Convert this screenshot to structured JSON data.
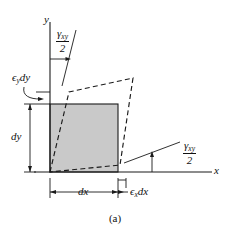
{
  "figure": {
    "caption": "(a)",
    "type": "strain-element-deformation-diagram",
    "axes": {
      "x_label": "x",
      "y_label": "y"
    },
    "labels": {
      "shear_numerator": "γ",
      "shear_subscript": "xy",
      "shear_denominator": "2",
      "shear_top": "γxy/2",
      "shear_right": "γxy/2",
      "normal_y": "ϵ",
      "normal_y_sub": "y",
      "normal_y_tail": "dy",
      "normal_x": "ϵ",
      "normal_x_sub": "x",
      "normal_x_tail": "dx",
      "dim_dy": "dy",
      "dim_dx": "dx"
    },
    "colors": {
      "element_fill": "#c9c9c9",
      "line": "#1a1a1a",
      "dashed": "#1a1a1a",
      "background": "#ffffff"
    },
    "geometry": {
      "origin": [
        50,
        172
      ],
      "element_square": [
        [
          50,
          104
        ],
        [
          118,
          104
        ],
        [
          118,
          172
        ],
        [
          50,
          172
        ]
      ],
      "deformed_parallelogram": [
        [
          50,
          172
        ],
        [
          69,
          92
        ],
        [
          133,
          78
        ],
        [
          120,
          165
        ]
      ]
    }
  }
}
